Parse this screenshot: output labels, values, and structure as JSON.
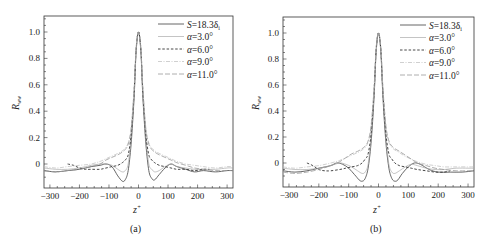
{
  "chart_data": [
    {
      "type": "line",
      "panel_label": "(a)",
      "title": "",
      "xlabel": "z+",
      "ylabel": "R_ww",
      "xlim": [
        -320,
        320
      ],
      "ylim": [
        -0.17,
        1.12
      ],
      "xticks": [
        -300,
        -200,
        -100,
        0,
        100,
        200,
        300
      ],
      "xtick_labels": [
        "−300",
        "−200",
        "−100",
        "0",
        "100",
        "200",
        "300"
      ],
      "yticks": [
        0,
        0.2,
        0.4,
        0.6,
        0.8,
        1.0
      ],
      "ytick_labels": [
        "0",
        "0.2",
        "0.4",
        "0.6",
        "0.8",
        "1.0"
      ],
      "grid": false,
      "legend_position": "upper right",
      "series": [
        {
          "name": "S=18.3δi",
          "style": "solid",
          "color": "#555555",
          "x": [
            -320,
            -280,
            -240,
            -200,
            -160,
            -130,
            -110,
            -90,
            -70,
            -55,
            -45,
            -35,
            -25,
            -15,
            -8,
            0,
            8,
            15,
            25,
            35,
            45,
            55,
            70,
            90,
            110,
            130,
            160,
            190,
            220,
            260,
            300,
            320
          ],
          "y": [
            -0.05,
            -0.06,
            -0.05,
            -0.04,
            -0.02,
            -0.01,
            0.0,
            -0.02,
            -0.09,
            -0.13,
            -0.12,
            -0.05,
            0.15,
            0.5,
            0.85,
            1.0,
            0.85,
            0.5,
            0.15,
            -0.05,
            -0.11,
            -0.12,
            -0.08,
            -0.03,
            0.0,
            -0.02,
            -0.04,
            -0.06,
            -0.05,
            -0.06,
            -0.05,
            -0.05
          ]
        },
        {
          "name": "α=3.0°",
          "style": "solid-light",
          "color": "#aaaaaa",
          "x": [
            -320,
            -280,
            -240,
            -200,
            -160,
            -130,
            -110,
            -90,
            -70,
            -55,
            -45,
            -35,
            -25,
            -15,
            -8,
            0,
            8,
            15,
            25,
            35,
            45,
            55,
            70,
            90,
            110,
            130,
            160,
            190,
            220,
            260,
            300,
            320
          ],
          "y": [
            -0.03,
            -0.04,
            -0.04,
            -0.03,
            -0.01,
            0.0,
            0.0,
            -0.01,
            -0.04,
            -0.06,
            -0.05,
            0.0,
            0.2,
            0.52,
            0.86,
            1.0,
            0.86,
            0.52,
            0.2,
            0.0,
            -0.04,
            -0.06,
            -0.05,
            -0.02,
            0.0,
            -0.02,
            -0.03,
            -0.04,
            -0.04,
            -0.04,
            -0.03,
            -0.03
          ]
        },
        {
          "name": "α=6.0°",
          "style": "dashed",
          "color": "#333333",
          "x": [
            -240,
            -220,
            -200,
            -180,
            -160,
            -130,
            -110,
            -90,
            -70,
            -55,
            -45,
            -35,
            -25,
            -15,
            -8,
            0,
            8,
            15,
            25,
            35,
            45,
            55,
            70,
            90,
            110,
            130,
            160,
            190,
            220,
            240
          ],
          "y": [
            0.0,
            -0.01,
            -0.03,
            -0.04,
            -0.04,
            -0.04,
            -0.03,
            -0.02,
            -0.01,
            0.01,
            0.03,
            0.07,
            0.22,
            0.54,
            0.87,
            1.0,
            0.87,
            0.54,
            0.22,
            0.07,
            0.03,
            0.01,
            -0.01,
            -0.02,
            -0.03,
            -0.04,
            -0.04,
            -0.05,
            -0.04,
            -0.04
          ]
        },
        {
          "name": "α=9.0°",
          "style": "dashdot-light",
          "color": "#bbbbbb",
          "x": [
            -320,
            -280,
            -240,
            -200,
            -160,
            -130,
            -110,
            -90,
            -70,
            -55,
            -45,
            -35,
            -25,
            -15,
            -8,
            0,
            8,
            15,
            25,
            35,
            45,
            55,
            70,
            90,
            110,
            130,
            160,
            190,
            220,
            260,
            300,
            320
          ],
          "y": [
            -0.02,
            -0.03,
            -0.02,
            -0.01,
            0.0,
            0.02,
            0.04,
            0.06,
            0.08,
            0.1,
            0.12,
            0.16,
            0.27,
            0.57,
            0.88,
            1.0,
            0.88,
            0.57,
            0.27,
            0.16,
            0.12,
            0.1,
            0.08,
            0.06,
            0.04,
            0.02,
            0.0,
            -0.01,
            -0.02,
            -0.03,
            -0.02,
            -0.02
          ]
        },
        {
          "name": "α=11.0°",
          "style": "longdash",
          "color": "#999999",
          "x": [
            -320,
            -280,
            -240,
            -200,
            -160,
            -130,
            -110,
            -90,
            -70,
            -55,
            -45,
            -35,
            -25,
            -15,
            -8,
            0,
            8,
            15,
            25,
            35,
            45,
            55,
            70,
            90,
            110,
            130,
            160,
            190,
            220,
            260,
            300,
            320
          ],
          "y": [
            -0.05,
            -0.06,
            -0.05,
            -0.04,
            -0.02,
            0.0,
            0.03,
            0.05,
            0.07,
            0.09,
            0.11,
            0.15,
            0.26,
            0.56,
            0.87,
            1.0,
            0.87,
            0.56,
            0.26,
            0.15,
            0.11,
            0.09,
            0.07,
            0.05,
            0.03,
            0.01,
            -0.01,
            -0.03,
            -0.04,
            -0.05,
            -0.05,
            -0.05
          ]
        }
      ]
    },
    {
      "type": "line",
      "panel_label": "(b)",
      "title": "",
      "xlabel": "z+",
      "ylabel": "R_ww",
      "xlim": [
        -320,
        320
      ],
      "ylim": [
        -0.17,
        1.12
      ],
      "xticks": [
        -300,
        -200,
        -100,
        0,
        100,
        200,
        300
      ],
      "xtick_labels": [
        "−300",
        "−200",
        "−100",
        "0",
        "100",
        "200",
        "300"
      ],
      "yticks": [
        0,
        0.2,
        0.4,
        0.6,
        0.8,
        1.0
      ],
      "ytick_labels": [
        "0",
        "0.2",
        "0.4",
        "0.6",
        "0.8",
        "1.0"
      ],
      "grid": false,
      "legend_position": "upper right",
      "series": [
        {
          "name": "S=18.3δi",
          "style": "solid",
          "color": "#555555",
          "x": [
            -320,
            -280,
            -240,
            -200,
            -160,
            -140,
            -120,
            -100,
            -80,
            -65,
            -55,
            -45,
            -35,
            -25,
            -15,
            -8,
            0,
            8,
            15,
            25,
            35,
            45,
            55,
            65,
            80,
            100,
            120,
            140,
            170,
            200,
            240,
            280,
            320
          ],
          "y": [
            -0.06,
            -0.07,
            -0.06,
            -0.04,
            -0.02,
            0.0,
            -0.01,
            -0.04,
            -0.09,
            -0.13,
            -0.14,
            -0.12,
            -0.04,
            0.15,
            0.5,
            0.85,
            1.0,
            0.85,
            0.5,
            0.15,
            -0.04,
            -0.12,
            -0.14,
            -0.13,
            -0.08,
            -0.03,
            0.0,
            -0.01,
            -0.05,
            -0.07,
            -0.07,
            -0.07,
            -0.06
          ]
        },
        {
          "name": "α=3.0°",
          "style": "solid-light",
          "color": "#aaaaaa",
          "x": [
            -320,
            -280,
            -240,
            -200,
            -160,
            -130,
            -110,
            -90,
            -70,
            -55,
            -45,
            -35,
            -25,
            -15,
            -8,
            0,
            8,
            15,
            25,
            35,
            45,
            55,
            70,
            90,
            110,
            130,
            160,
            190,
            220,
            260,
            300,
            320
          ],
          "y": [
            -0.04,
            -0.05,
            -0.05,
            -0.04,
            -0.02,
            0.0,
            -0.01,
            -0.03,
            -0.06,
            -0.08,
            -0.07,
            -0.01,
            0.19,
            0.52,
            0.86,
            1.0,
            0.86,
            0.52,
            0.19,
            -0.01,
            -0.07,
            -0.08,
            -0.06,
            -0.03,
            -0.01,
            -0.02,
            -0.04,
            -0.05,
            -0.05,
            -0.04,
            -0.04,
            -0.04
          ]
        },
        {
          "name": "α=6.0°",
          "style": "dashed",
          "color": "#333333",
          "x": [
            -240,
            -220,
            -200,
            -180,
            -160,
            -130,
            -110,
            -90,
            -70,
            -55,
            -45,
            -35,
            -25,
            -15,
            -8,
            0,
            8,
            15,
            25,
            35,
            45,
            55,
            70,
            90,
            110,
            130,
            160,
            190,
            220,
            240
          ],
          "y": [
            0.0,
            -0.02,
            -0.05,
            -0.06,
            -0.06,
            -0.05,
            -0.04,
            -0.03,
            -0.02,
            0.0,
            0.03,
            0.07,
            0.22,
            0.54,
            0.87,
            1.0,
            0.87,
            0.54,
            0.22,
            0.07,
            0.03,
            0.0,
            -0.02,
            -0.03,
            -0.04,
            -0.05,
            -0.06,
            -0.07,
            -0.07,
            -0.06
          ]
        },
        {
          "name": "α=9.0°",
          "style": "dashdot-light",
          "color": "#bbbbbb",
          "x": [
            -320,
            -280,
            -240,
            -200,
            -160,
            -130,
            -110,
            -90,
            -70,
            -55,
            -45,
            -35,
            -25,
            -15,
            -8,
            0,
            8,
            15,
            25,
            35,
            45,
            55,
            70,
            90,
            110,
            130,
            160,
            190,
            220,
            260,
            300,
            320
          ],
          "y": [
            -0.03,
            -0.04,
            -0.03,
            -0.02,
            0.0,
            0.02,
            0.04,
            0.06,
            0.08,
            0.1,
            0.12,
            0.16,
            0.27,
            0.57,
            0.88,
            1.0,
            0.88,
            0.57,
            0.27,
            0.16,
            0.12,
            0.1,
            0.08,
            0.05,
            0.03,
            0.01,
            -0.01,
            -0.02,
            -0.03,
            -0.03,
            -0.03,
            -0.03
          ]
        },
        {
          "name": "α=11.0°",
          "style": "longdash",
          "color": "#999999",
          "x": [
            -320,
            -280,
            -240,
            -200,
            -160,
            -130,
            -110,
            -90,
            -70,
            -55,
            -45,
            -35,
            -25,
            -15,
            -8,
            0,
            8,
            15,
            25,
            35,
            45,
            55,
            70,
            90,
            110,
            130,
            160,
            190,
            220,
            260,
            300,
            320
          ],
          "y": [
            -0.07,
            -0.08,
            -0.07,
            -0.05,
            -0.02,
            0.01,
            0.04,
            0.07,
            0.09,
            0.11,
            0.13,
            0.17,
            0.28,
            0.57,
            0.88,
            1.0,
            0.88,
            0.57,
            0.28,
            0.17,
            0.13,
            0.11,
            0.09,
            0.06,
            0.03,
            0.0,
            -0.02,
            -0.04,
            -0.05,
            -0.06,
            -0.06,
            -0.06
          ]
        }
      ]
    }
  ],
  "panels": [
    {
      "label": "(a)",
      "xlabel_base": "z",
      "xlabel_sup": "+",
      "ylabel_base": "R",
      "ylabel_sub": "ww"
    },
    {
      "label": "(b)",
      "xlabel_base": "z",
      "xlabel_sup": "+",
      "ylabel_base": "R",
      "ylabel_sub": "ww"
    }
  ],
  "legend": [
    {
      "prefix": "S",
      "text": "=18.3δ",
      "sub": "i"
    },
    {
      "prefix": "α",
      "text": "=3.0°",
      "sub": ""
    },
    {
      "prefix": "α",
      "text": "=6.0°",
      "sub": ""
    },
    {
      "prefix": "α",
      "text": "=9.0°",
      "sub": ""
    },
    {
      "prefix": "α",
      "text": "=11.0°",
      "sub": ""
    }
  ]
}
